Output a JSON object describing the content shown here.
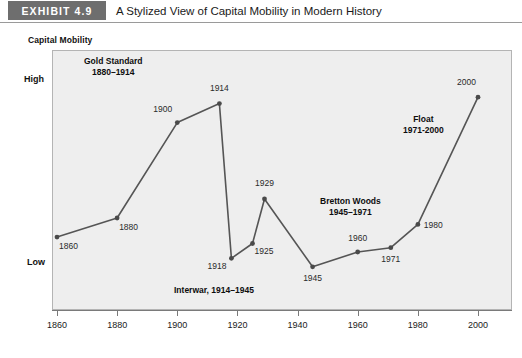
{
  "header": {
    "badge": "EXHIBIT 4.9",
    "title": "A Stylized View of Capital Mobility in Modern History",
    "badge_color": "#6e6e6e"
  },
  "axes": {
    "y_title": "Capital Mobility",
    "y_high": "High",
    "y_low": "Low"
  },
  "source": {
    "text": ""
  },
  "chart_data": {
    "type": "line",
    "title": "A Stylized View of Capital Mobility in Modern History",
    "xlabel": "",
    "ylabel": "Capital Mobility",
    "xlim": [
      1860,
      2000
    ],
    "ylim": [
      0,
      100
    ],
    "grid": false,
    "legend": "none",
    "line_color": "#555555",
    "marker_color": "#4a4a4a",
    "plot_background": "#eeeeee",
    "x_ticks": [
      1860,
      1880,
      1900,
      1920,
      1940,
      1960,
      1980,
      2000
    ],
    "x_tick_labels": [
      "1860",
      "1880",
      "1900",
      "1920",
      "1940",
      "1960",
      "1980",
      "2000"
    ],
    "y_tick_labels": [
      "Low",
      "High"
    ],
    "y_tick_values": [
      24,
      88
    ],
    "x": [
      1860,
      1880,
      1900,
      1914,
      1918,
      1925,
      1929,
      1945,
      1960,
      1971,
      1980,
      2000
    ],
    "values": [
      24,
      33,
      78,
      87,
      14,
      21,
      42,
      10,
      17,
      19,
      30,
      90
    ],
    "point_labels": [
      "1860",
      "1880",
      "1900",
      "1914",
      "1918",
      "1925",
      "1929",
      "1945",
      "1960",
      "1971",
      "1980",
      "2000"
    ],
    "annotations": [
      {
        "id": "gold",
        "line1": "Gold Standard",
        "line2": "1880–1914"
      },
      {
        "id": "interwar",
        "line1": "Interwar, 1914–1945",
        "line2": ""
      },
      {
        "id": "bretton",
        "line1": "Bretton Woods",
        "line2": "1945–1971"
      },
      {
        "id": "float",
        "line1": "Float",
        "line2": "1971-2000"
      }
    ]
  }
}
